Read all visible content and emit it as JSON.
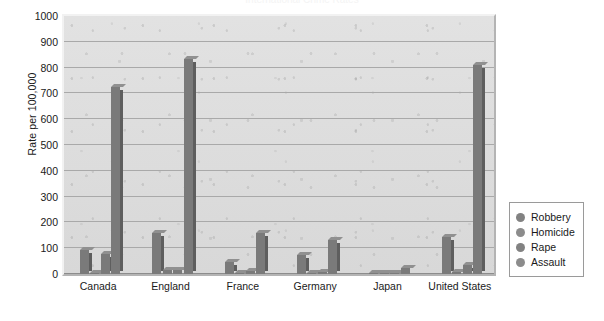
{
  "chart_data": {
    "type": "bar",
    "title": "International Crime Rates",
    "xlabel": "",
    "ylabel": "Rate per 100,000",
    "ylim": [
      0,
      1000
    ],
    "ytick_step": 100,
    "yticks": [
      1000,
      900,
      800,
      700,
      600,
      500,
      400,
      300,
      200,
      100,
      0
    ],
    "grid": true,
    "legend_position": "right",
    "categories": [
      "Canada",
      "England",
      "France",
      "Germany",
      "Japan",
      "United States"
    ],
    "series": [
      {
        "name": "Robbery",
        "values": [
          95,
          160,
          45,
          75,
          3,
          145
        ]
      },
      {
        "name": "Homicide",
        "values": [
          2,
          15,
          4,
          4,
          1,
          9
        ]
      },
      {
        "name": "Rape",
        "values": [
          78,
          15,
          12,
          9,
          2,
          35
        ]
      },
      {
        "name": "Assault",
        "values": [
          725,
          835,
          160,
          130,
          22,
          810
        ]
      }
    ]
  },
  "chart": {
    "title": "International Crime Rates",
    "y_axis_title": "Rate per 100,000",
    "y_tick_labels": [
      "1000",
      "900",
      "800",
      "700",
      "600",
      "500",
      "400",
      "300",
      "200",
      "100",
      "0"
    ],
    "x_tick_labels": [
      "Canada",
      "England",
      "France",
      "Germany",
      "Japan",
      "United States"
    ]
  },
  "legend": {
    "items": [
      {
        "label": "Robbery",
        "color": "#828282"
      },
      {
        "label": "Homicide",
        "color": "#8c8c8c"
      },
      {
        "label": "Rape",
        "color": "#828282"
      },
      {
        "label": "Assault",
        "color": "#8c8c8c"
      }
    ]
  },
  "colors": {
    "bar_face": "#7a7a7a",
    "bar_side": "#5e5e5e",
    "bar_top": "#909090",
    "plot_background": "#dcdcdc",
    "gridline": "#a9a9a9",
    "text": "#1a1a1a",
    "page_background": "#ffffff"
  }
}
